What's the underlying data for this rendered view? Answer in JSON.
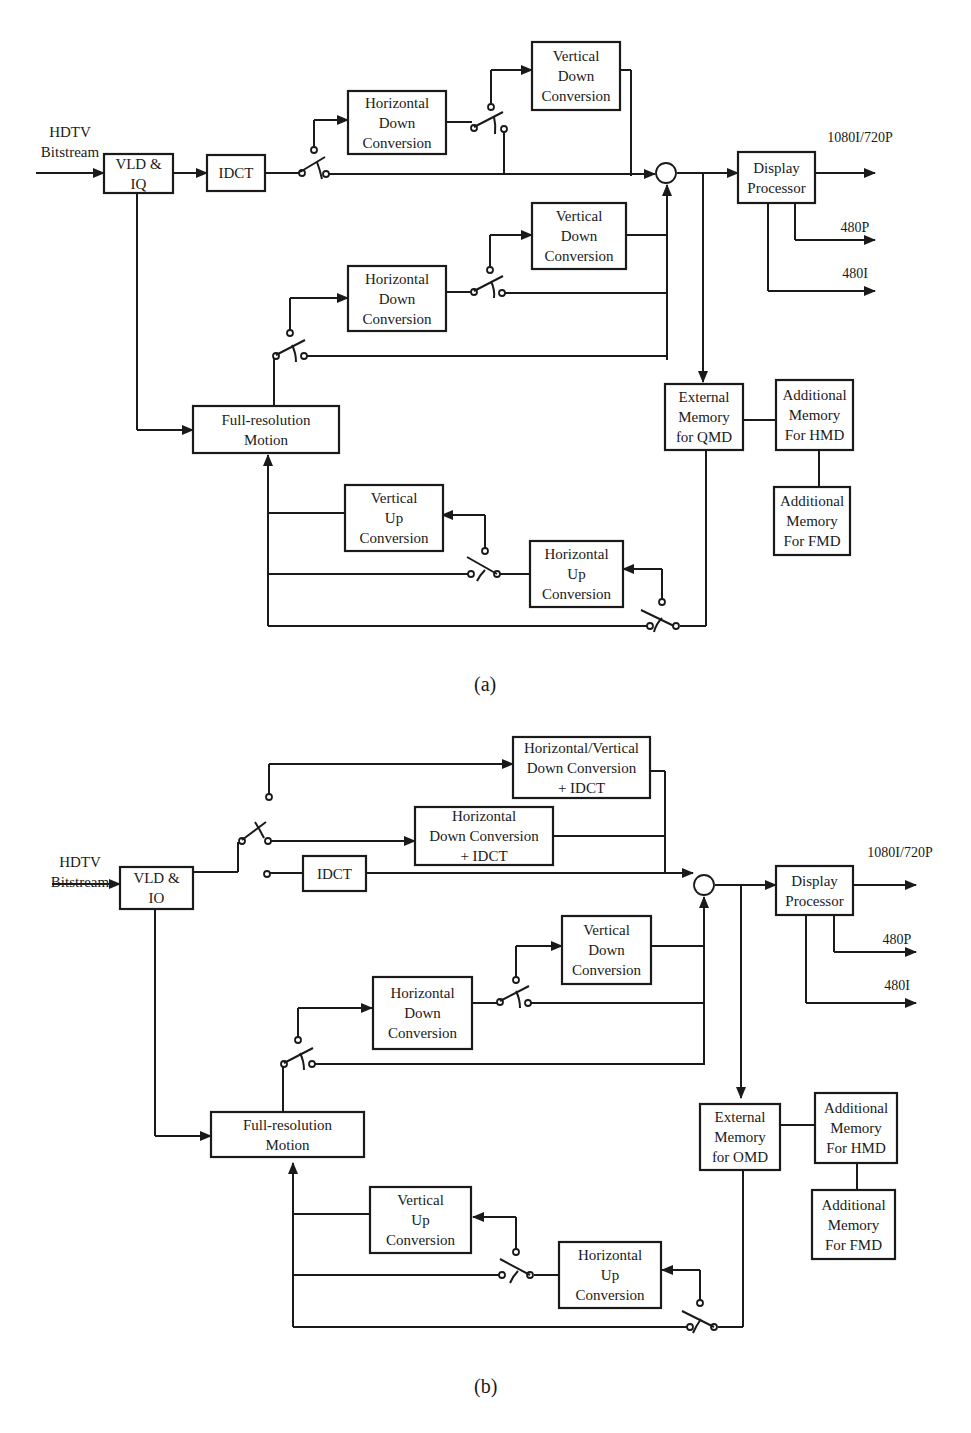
{
  "diagram_a": {
    "caption": "(a)",
    "input_label": "HDTV\nBitstream",
    "boxes": {
      "vld": "VLD &\nIQ",
      "idct": "IDCT",
      "hdc_top": "Horizontal\nDown\nConversion",
      "vdc_top": "Vertical\nDown\nConversion",
      "vdc_mid": "Vertical\nDown\nConversion",
      "hdc_mid": "Horizontal\nDown\nConversion",
      "full_res": "Full-resolution\nMotion",
      "vuc": "Vertical\nUp\nConversion",
      "huc": "Horizontal\nUp\nConversion",
      "display": "Display\nProcessor",
      "ext_mem": "External\nMemory\nfor QMD",
      "add_hmd": "Additional\nMemory\nFor HMD",
      "add_fmd": "Additional\nMemory\nFor FMD"
    },
    "outputs": [
      "1080I/720P",
      "480P",
      "480I"
    ]
  },
  "diagram_b": {
    "caption": "(b)",
    "input_label": "HDTV\nBitstream",
    "boxes": {
      "vld": "VLD &\nIO",
      "idct": "IDCT",
      "hvdc_idct": "Horizontal/Vertical\nDown Conversion\n+ IDCT",
      "hdc_idct": "Horizontal\nDown Conversion\n+ IDCT",
      "vdc_mid": "Vertical\nDown\nConversion",
      "hdc_mid": "Horizontal\nDown\nConversion",
      "full_res": "Full-resolution\nMotion",
      "vuc": "Vertical\nUp\nConversion",
      "huc": "Horizontal\nUp\nConversion",
      "display": "Display\nProcessor",
      "ext_mem": "External\nMemory\nfor OMD",
      "add_hmd": "Additional\nMemory\nFor HMD",
      "add_fmd": "Additional\nMemory\nFor FMD"
    },
    "outputs": [
      "1080I/720P",
      "480P",
      "480I"
    ]
  }
}
